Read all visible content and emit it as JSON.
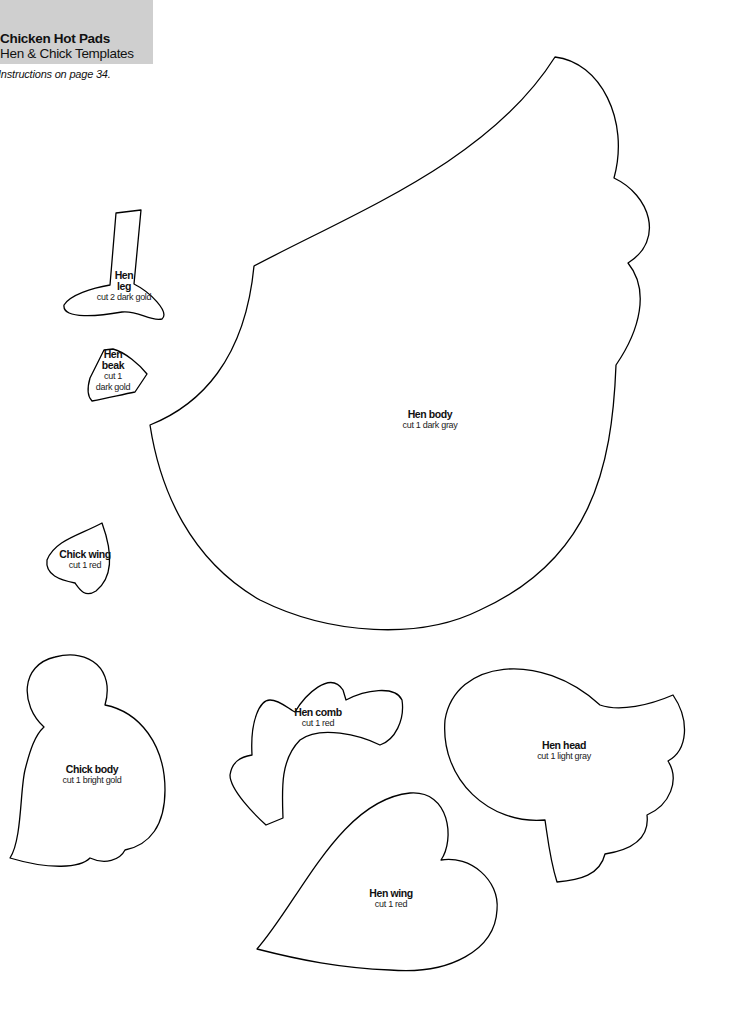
{
  "header": {
    "title": "Chicken Hot Pads",
    "subtitle": "Hen & Chick Templates",
    "background_color": "#cfcfcf"
  },
  "instructions": "Instructions on page 34.",
  "pieces": [
    {
      "id": "hen-leg",
      "name_line1": "Hen",
      "name_line2": "leg",
      "cut": "cut 2 dark gold"
    },
    {
      "id": "hen-beak",
      "name_line1": "Hen",
      "name_line2": "beak",
      "cut_line1": "cut 1",
      "cut_line2": "dark gold"
    },
    {
      "id": "hen-body",
      "name": "Hen body",
      "cut": "cut 1 dark gray"
    },
    {
      "id": "chick-wing",
      "name": "Chick wing",
      "cut": "cut 1 red"
    },
    {
      "id": "chick-body",
      "name": "Chick body",
      "cut": "cut 1 bright gold"
    },
    {
      "id": "hen-comb",
      "name": "Hen comb",
      "cut": "cut 1 red"
    },
    {
      "id": "hen-head",
      "name": "Hen head",
      "cut": "cut 1 light gray"
    },
    {
      "id": "hen-wing",
      "name": "Hen wing",
      "cut": "cut 1 red"
    }
  ]
}
